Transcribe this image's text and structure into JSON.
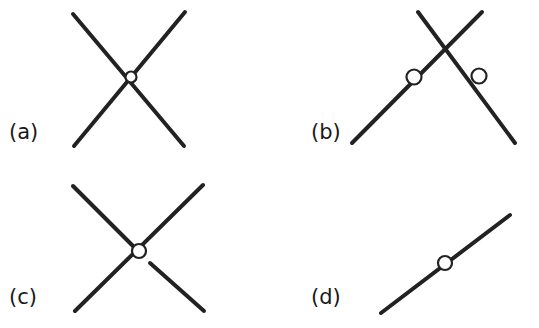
{
  "figure": {
    "background_color": "#ffffff",
    "stroke_color": "#222222",
    "width": 539,
    "height": 328,
    "panels": [
      {
        "id": "a",
        "label": "(a)",
        "label_x": 9,
        "label_y": 122,
        "description": "two straight lines crossing at a single point with a small open circle marking the vertex",
        "lines": [
          {
            "name": "line-nw-se",
            "x1": 73,
            "y1": 14,
            "x2": 184,
            "y2": 146
          },
          {
            "name": "line-ne-sw",
            "x1": 185,
            "y1": 12,
            "x2": 74,
            "y2": 146
          }
        ],
        "circles": [
          {
            "name": "vertex-marker",
            "cx": 131,
            "cy": 77,
            "r": 5.5
          }
        ]
      },
      {
        "id": "b",
        "label": "(b)",
        "label_x": 311,
        "label_y": 122,
        "description": "two straight lines crossing near the top, each lower leg carrying an open circle marker",
        "lines": [
          {
            "name": "line-nw-se",
            "x1": 418,
            "y1": 12,
            "x2": 515,
            "y2": 143
          },
          {
            "name": "line-ne-sw",
            "x1": 482,
            "y1": 12,
            "x2": 352,
            "y2": 143
          }
        ],
        "circles": [
          {
            "name": "left-leg-marker",
            "cx": 414,
            "cy": 77,
            "r": 7.5
          },
          {
            "name": "right-leg-marker",
            "cx": 479,
            "cy": 76,
            "r": 7.5
          }
        ]
      },
      {
        "id": "c",
        "label": "(c)",
        "label_x": 9,
        "label_y": 287,
        "description": "two straight lines crossing with an open circle at the vertex; the lower-right leg is broken by a gap just past the circle",
        "lines": [
          {
            "name": "line-nw-se-upper",
            "x1": 73,
            "y1": 186,
            "x2": 137,
            "y2": 250
          },
          {
            "name": "line-nw-se-lower",
            "x1": 150,
            "y1": 263,
            "x2": 204,
            "y2": 311
          },
          {
            "name": "line-ne-sw",
            "x1": 203,
            "y1": 185,
            "x2": 75,
            "y2": 311
          }
        ],
        "circles": [
          {
            "name": "vertex-marker",
            "cx": 139,
            "cy": 251,
            "r": 7.0
          }
        ]
      },
      {
        "id": "d",
        "label": "(d)",
        "label_x": 311,
        "label_y": 287,
        "description": "a single straight line running from lower-left to upper-right with one open circle marker near its midpoint",
        "lines": [
          {
            "name": "line-sw-ne",
            "x1": 381,
            "y1": 313,
            "x2": 510,
            "y2": 215
          }
        ],
        "circles": [
          {
            "name": "midpoint-marker",
            "cx": 445,
            "cy": 263,
            "r": 7.0
          }
        ]
      }
    ]
  }
}
